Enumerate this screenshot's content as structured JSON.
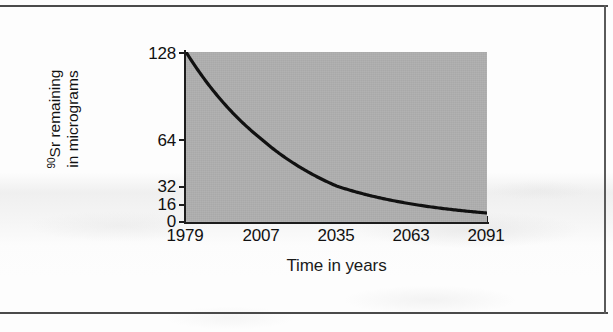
{
  "figure": {
    "background_color": "#fdfdfd",
    "frame_color": "#4a4a4a",
    "plot_fill_color": "#a9a9a9",
    "curve_color": "#111111"
  },
  "axes": {
    "y_title_superscript": "90",
    "y_title_line1": "Sr remaining",
    "y_title_line2": "in micrograms",
    "x_title": "Time in years"
  },
  "chart_data": {
    "type": "line",
    "title": "",
    "subtitle": "",
    "xlabel": "Time in years",
    "ylabel": "90Sr remaining in micrograms",
    "x": [
      1979,
      2007,
      2035,
      2063,
      2091
    ],
    "xtick_labels": [
      "1979",
      "2007",
      "2035",
      "2063",
      "2091"
    ],
    "ytick_labels": [
      "128",
      "64",
      "32",
      "16",
      "0"
    ],
    "ytick_values": [
      128,
      64,
      32,
      16,
      0
    ],
    "values": [
      128,
      64,
      32,
      16,
      8
    ],
    "series": [
      {
        "name": "Strontium-90 remaining",
        "values": [
          128,
          64,
          32,
          16,
          8
        ]
      }
    ],
    "xlim": [
      1979,
      2091
    ],
    "ylim": [
      0,
      128
    ],
    "y_scale": "log2-like (half-life spacing)",
    "half_life_years": 28,
    "grid": false,
    "legend": false,
    "legend_position": "none",
    "annotations": [],
    "plot_background": "#a9a9a9"
  }
}
